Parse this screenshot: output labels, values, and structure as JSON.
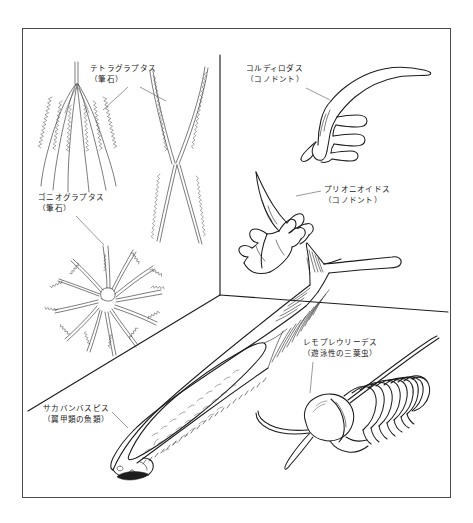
{
  "figure": {
    "kind": "scientific-illustration",
    "background_color": "#ffffff",
    "ink_color": "#1d1d1d",
    "frame_color": "#4a4a4a",
    "border": {
      "x": 22,
      "y": 28,
      "width": 429,
      "height": 470
    }
  },
  "labels": [
    {
      "id": "tetragraptus",
      "name": "テトラグラプタス",
      "qualifier": "（筆石）",
      "x": 90,
      "y": 64,
      "leaders": [
        {
          "x1": 128,
          "y1": 87,
          "x2": 103,
          "y2": 110
        },
        {
          "x1": 140,
          "y1": 87,
          "x2": 166,
          "y2": 101
        }
      ]
    },
    {
      "id": "goniograptus",
      "name": "ゴニオグラプタス",
      "qualifier": "（筆石）",
      "x": 38,
      "y": 193,
      "leaders": [
        {
          "x1": 76,
          "y1": 216,
          "x2": 104,
          "y2": 245
        }
      ]
    },
    {
      "id": "cordylodus",
      "name": "コルディロダス",
      "qualifier": "（コノドント）",
      "x": 246,
      "y": 64,
      "leaders": [
        {
          "x1": 306,
          "y1": 88,
          "x2": 330,
          "y2": 100
        }
      ]
    },
    {
      "id": "prioniodus",
      "name": "プリオニオイドス",
      "qualifier": "（コノドント）",
      "x": 324,
      "y": 185,
      "leaders": [
        {
          "x1": 321,
          "y1": 191,
          "x2": 296,
          "y2": 196
        }
      ]
    },
    {
      "id": "remopleurides",
      "name": "レモプレウリーデス",
      "qualifier": "（遊泳性の三葉虫）",
      "x": 303,
      "y": 338,
      "leaders": [
        {
          "x1": 313,
          "y1": 362,
          "x2": 310,
          "y2": 393
        }
      ]
    },
    {
      "id": "sacabambaspis",
      "name": "サカバンバスピス",
      "qualifier": "（翼甲類の魚類）",
      "x": 43,
      "y": 404,
      "leaders": [
        {
          "x1": 112,
          "y1": 412,
          "x2": 128,
          "y2": 428
        }
      ]
    }
  ],
  "scene": {
    "corner_vertical": {
      "x": 220,
      "y_top": 55,
      "y_bottom": 295
    },
    "floor_left": {
      "x1": 28,
      "y1": 410,
      "x2": 220,
      "y2": 295
    },
    "floor_right": {
      "x1": 220,
      "y1": 295,
      "x2": 445,
      "y2": 312
    }
  },
  "specimens": [
    {
      "id": "tetragraptus",
      "common_name": "Tetragraptus",
      "group": "graptolite",
      "description": "four serrated branches radiating downward from a slender nema stem",
      "branch_count": 4
    },
    {
      "id": "tetragraptus-x",
      "common_name": "Tetragraptus (X form)",
      "group": "graptolite",
      "description": "two crossed serrated stipes forming an X",
      "branch_count": 4
    },
    {
      "id": "goniograptus",
      "common_name": "Goniograptus",
      "group": "graptolite",
      "description": "radial starburst of many curved serrated stipes",
      "branch_count": 18
    },
    {
      "id": "cordylodus",
      "common_name": "Cordylodus",
      "group": "conodont",
      "description": "claw-shaped element with long recurved cusp and three denticles",
      "denticle_count": 3
    },
    {
      "id": "prioniodus",
      "common_name": "Prioniodus",
      "group": "conodont",
      "description": "two-branched element with tall cusp and rows of denticles",
      "denticle_count": 7
    },
    {
      "id": "sacabambaspis",
      "common_name": "Sacabambaspis",
      "group": "ostracoderm fish",
      "description": "armoured jawless fish with large head shield and forked tail"
    },
    {
      "id": "remopleurides",
      "common_name": "Remopleurides",
      "group": "trilobite",
      "description": "pelagic trilobite with large bulbous cephalon, segmented thorax and long antennae"
    }
  ]
}
